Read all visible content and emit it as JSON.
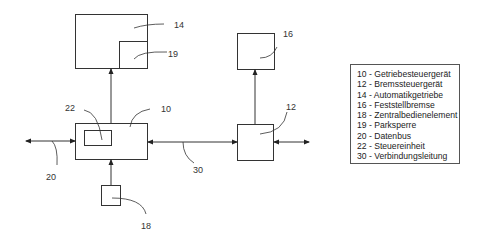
{
  "diagram": {
    "blocks": [
      {
        "id": "14",
        "label": "14",
        "name": "Automatikgetriebe"
      },
      {
        "id": "19",
        "label": "19",
        "name": "Parksperre"
      },
      {
        "id": "16",
        "label": "16",
        "name": "Feststellbremse"
      },
      {
        "id": "10",
        "label": "10",
        "name": "Getriebesteuergerät"
      },
      {
        "id": "22",
        "label": "22",
        "name": "Steuereinheit"
      },
      {
        "id": "12",
        "label": "12",
        "name": "Bremssteuergerät"
      },
      {
        "id": "18",
        "label": "18",
        "name": "Zentralbedienelement"
      }
    ],
    "connections": [
      {
        "id": "20",
        "label": "20",
        "name": "Datenbus"
      },
      {
        "id": "30",
        "label": "30",
        "name": "Verbindungsleitung"
      }
    ],
    "colors": {
      "line": "#333333",
      "background": "#ffffff"
    }
  },
  "legend": {
    "items": [
      "10 - Getriebesteuergerät",
      "12 - Bremssteuergerät",
      "14 - Automatikgetriebe",
      "16 - Feststellbremse",
      "18 - Zentralbedienelement",
      "19 - Parksperre",
      "20 - Datenbus",
      "22 - Steuereinheit",
      "30 - Verbindungsleitung"
    ]
  }
}
